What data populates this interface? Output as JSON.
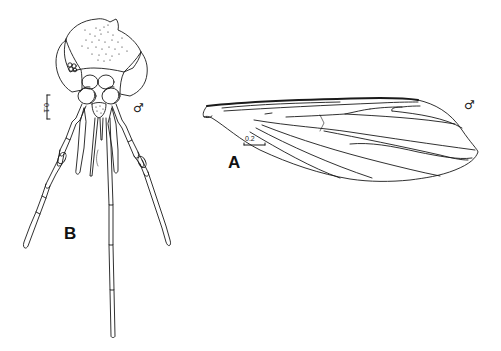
{
  "figure": {
    "panels": [
      {
        "id": "A",
        "label": "A",
        "subject": "wing",
        "sex_symbol": "♂",
        "scale_bar": {
          "value": "0.2",
          "orientation": "horizontal"
        }
      },
      {
        "id": "B",
        "label": "B",
        "subject": "head",
        "sex_symbol": "♂",
        "scale_bar": {
          "value": "0.1",
          "orientation": "vertical"
        }
      }
    ],
    "colors": {
      "line": "#1a1a1a",
      "background": "#ffffff"
    }
  }
}
